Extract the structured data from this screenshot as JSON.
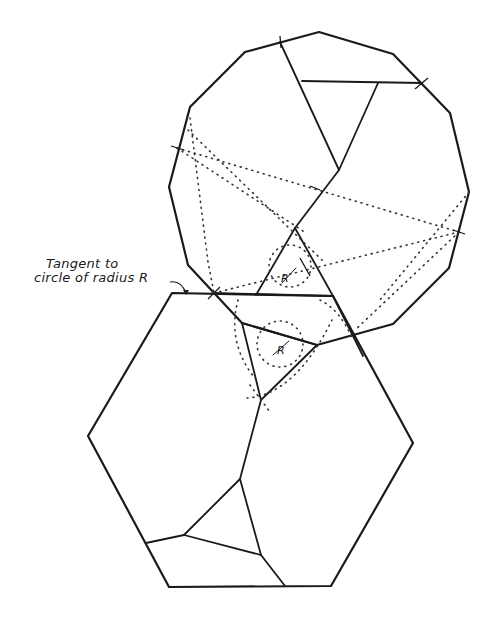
{
  "annotation": {
    "line1": "Tangent to",
    "line2": "circle of radius R"
  },
  "radius_labels": {
    "upper": "R",
    "lower": "R"
  },
  "shapes": {
    "dodecagon": "regular 12-sided polygon (upper)",
    "hexagon": "regular hexagon (lower)"
  },
  "colors": {
    "stroke": "#1a1a1a",
    "background": "#ffffff"
  }
}
